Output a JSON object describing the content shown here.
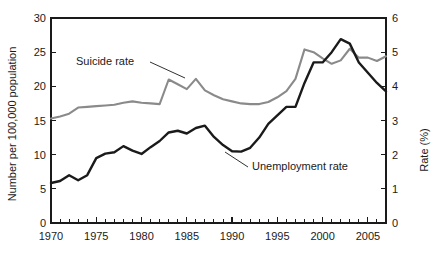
{
  "chart_data": {
    "type": "line",
    "title": "",
    "xlabel": "",
    "ylabel": "Number per 100,000 population",
    "y2label": "Rate (%)",
    "xlim": [
      1970,
      2007
    ],
    "ylim": [
      0,
      30
    ],
    "y2lim": [
      0,
      6
    ],
    "grid": false,
    "legend_position": "inline-annotations",
    "x": [
      1970,
      1971,
      1972,
      1973,
      1974,
      1975,
      1976,
      1977,
      1978,
      1979,
      1980,
      1981,
      1982,
      1983,
      1984,
      1985,
      1986,
      1987,
      1988,
      1989,
      1990,
      1991,
      1992,
      1993,
      1994,
      1995,
      1996,
      1997,
      1998,
      1999,
      2000,
      2001,
      2002,
      2003,
      2004,
      2005,
      2006,
      2007
    ],
    "xticks_major": [
      1970,
      1975,
      1980,
      1985,
      1990,
      1995,
      2000,
      2005
    ],
    "xticks_major_labels": [
      "1970",
      "1975",
      "1980",
      "1985",
      "1990",
      "1995",
      "2000",
      "2005"
    ],
    "yticks": [
      0,
      5,
      10,
      15,
      20,
      25,
      30
    ],
    "ytick_labels": [
      "0",
      "5",
      "10",
      "15",
      "20",
      "25",
      "30"
    ],
    "y2ticks": [
      0,
      1,
      2,
      3,
      4,
      5,
      6
    ],
    "y2tick_labels": [
      "0",
      "1",
      "2",
      "3",
      "4",
      "5",
      "6"
    ],
    "series": [
      {
        "name": "Suicide rate",
        "axis": "left",
        "color": "#8a8a8a",
        "unit": "per 100,000 population",
        "values": [
          15.3,
          15.6,
          16.0,
          16.9,
          17.0,
          17.1,
          17.2,
          17.3,
          17.6,
          17.8,
          17.6,
          17.5,
          17.4,
          21.0,
          20.3,
          19.6,
          21.1,
          19.4,
          18.7,
          18.1,
          17.8,
          17.5,
          17.4,
          17.4,
          17.7,
          18.4,
          19.3,
          21.1,
          25.4,
          25.0,
          24.1,
          23.3,
          23.8,
          25.5,
          24.2,
          24.2,
          23.7,
          24.4
        ]
      },
      {
        "name": "Unemployment rate",
        "axis": "right",
        "color": "#1a1a1a",
        "unit": "%",
        "values": [
          1.17,
          1.23,
          1.4,
          1.25,
          1.4,
          1.9,
          2.03,
          2.07,
          2.25,
          2.12,
          2.02,
          2.22,
          2.4,
          2.65,
          2.7,
          2.62,
          2.78,
          2.85,
          2.52,
          2.28,
          2.1,
          2.09,
          2.2,
          2.5,
          2.9,
          3.15,
          3.4,
          3.4,
          4.1,
          4.7,
          4.7,
          5.0,
          5.38,
          5.25,
          4.7,
          4.4,
          4.1,
          3.85
        ]
      }
    ],
    "annotations": [
      {
        "name": "suicide-rate-annotation",
        "text": "Suicide rate",
        "text_x": 76,
        "text_y": 65,
        "leader": "M 150 62 L 185 78"
      },
      {
        "name": "unemployment-rate-annotation",
        "text": "Unemployment rate",
        "text_x": 252,
        "text_y": 170,
        "leader": "M 248 167 L 225 152"
      }
    ]
  }
}
